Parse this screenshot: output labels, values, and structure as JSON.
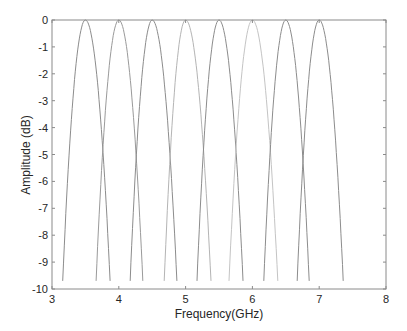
{
  "chart_data": {
    "type": "line",
    "title": "",
    "xlabel": "Frequency(GHz)",
    "ylabel": "Amplitude (dB)",
    "xlim": [
      3,
      8
    ],
    "ylim": [
      -10,
      0
    ],
    "xticks": [
      3,
      4,
      5,
      6,
      7,
      8
    ],
    "yticks": [
      0,
      -1,
      -2,
      -3,
      -4,
      -5,
      -6,
      -7,
      -8,
      -9,
      -10
    ],
    "xtick_labels": [
      "3",
      "4",
      "5",
      "6",
      "7",
      "8"
    ],
    "ytick_labels": [
      "0",
      "-1",
      "-2",
      "-3",
      "-4",
      "-5",
      "-6",
      "-7",
      "-8",
      "-9",
      "-10"
    ],
    "grid": false,
    "legend": null,
    "series": [
      {
        "name": "band-1",
        "center_ghz": 3.5,
        "peak_db": 0,
        "x_at_minus10db": [
          3.16,
          3.87
        ],
        "color": "#8c8c8c"
      },
      {
        "name": "band-2",
        "center_ghz": 4.0,
        "peak_db": 0,
        "x_at_minus10db": [
          3.66,
          4.36
        ],
        "color": "#9a9a9a"
      },
      {
        "name": "band-3",
        "center_ghz": 4.5,
        "peak_db": 0,
        "x_at_minus10db": [
          4.17,
          4.87
        ],
        "color": "#8c8c8c"
      },
      {
        "name": "band-4",
        "center_ghz": 5.0,
        "peak_db": 0,
        "x_at_minus10db": [
          4.68,
          5.38
        ],
        "color": "#b4b4b4"
      },
      {
        "name": "band-5",
        "center_ghz": 5.5,
        "peak_db": 0,
        "x_at_minus10db": [
          5.17,
          5.86
        ],
        "color": "#8c8c8c"
      },
      {
        "name": "band-6",
        "center_ghz": 6.0,
        "peak_db": 0,
        "x_at_minus10db": [
          5.65,
          6.38
        ],
        "color": "#c4c4c4"
      },
      {
        "name": "band-7",
        "center_ghz": 6.5,
        "peak_db": 0,
        "x_at_minus10db": [
          6.17,
          6.85
        ],
        "color": "#8c8c8c"
      },
      {
        "name": "band-8",
        "center_ghz": 7.0,
        "peak_db": 0,
        "x_at_minus10db": [
          6.67,
          7.36
        ],
        "color": "#8c8c8c"
      }
    ]
  },
  "layout": {
    "plot": {
      "left": 52,
      "top": 20,
      "right": 386,
      "bottom": 289
    },
    "axis_color": "#8a8a8a"
  }
}
